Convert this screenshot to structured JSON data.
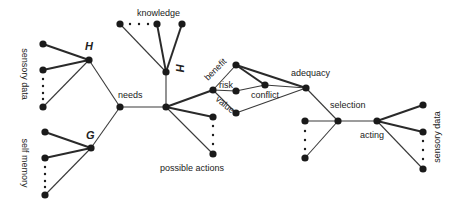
{
  "diagram": {
    "labels": {
      "sensory_data_left": "sensory data",
      "self_memory": "self memory",
      "H_top": "H",
      "G": "G",
      "needs": "needs",
      "knowledge": "knowledge",
      "H_mid": "H",
      "benefit": "benefit",
      "risk": "risk",
      "value": "value",
      "conflict": "conflict",
      "adequacy": "adequacy",
      "possible_actions": "possible actions",
      "selection": "selection",
      "acting": "acting",
      "sensory_data_right": "sensory data"
    },
    "nodes": [
      {
        "id": "s1",
        "x": 43,
        "y": 44
      },
      {
        "id": "s2",
        "x": 43,
        "y": 70
      },
      {
        "id": "s3",
        "x": 43,
        "y": 107
      },
      {
        "id": "H1",
        "x": 89,
        "y": 60
      },
      {
        "id": "m1",
        "x": 45,
        "y": 132
      },
      {
        "id": "m2",
        "x": 45,
        "y": 158
      },
      {
        "id": "m3",
        "x": 45,
        "y": 195
      },
      {
        "id": "G",
        "x": 91,
        "y": 148
      },
      {
        "id": "needs",
        "x": 120,
        "y": 107
      },
      {
        "id": "k1",
        "x": 120,
        "y": 24
      },
      {
        "id": "k2",
        "x": 157,
        "y": 24
      },
      {
        "id": "k3",
        "x": 182,
        "y": 24
      },
      {
        "id": "H2",
        "x": 166,
        "y": 72
      },
      {
        "id": "hub",
        "x": 166,
        "y": 107
      },
      {
        "id": "rh",
        "x": 213,
        "y": 90
      },
      {
        "id": "benefit",
        "x": 236,
        "y": 65
      },
      {
        "id": "risk",
        "x": 236,
        "y": 91
      },
      {
        "id": "value",
        "x": 236,
        "y": 113
      },
      {
        "id": "conflict",
        "x": 265,
        "y": 85
      },
      {
        "id": "adequacy",
        "x": 306,
        "y": 88
      },
      {
        "id": "a1",
        "x": 213,
        "y": 117
      },
      {
        "id": "a2",
        "x": 213,
        "y": 154
      },
      {
        "id": "sel",
        "x": 338,
        "y": 121
      },
      {
        "id": "l1",
        "x": 305,
        "y": 121
      },
      {
        "id": "l2",
        "x": 305,
        "y": 158
      },
      {
        "id": "act",
        "x": 377,
        "y": 121
      },
      {
        "id": "r1",
        "x": 423,
        "y": 105
      },
      {
        "id": "r2",
        "x": 423,
        "y": 132
      },
      {
        "id": "r3",
        "x": 423,
        "y": 169
      }
    ]
  }
}
